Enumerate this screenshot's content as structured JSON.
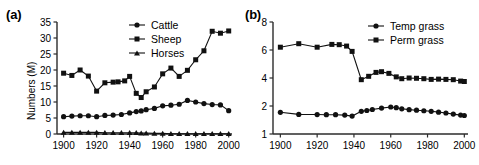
{
  "figure": {
    "panels": [
      {
        "id": "a",
        "label": "(a)",
        "ylabel": "Numbers (M)",
        "xlabel": "",
        "legend_position": "top-center"
      },
      {
        "id": "b",
        "label": "(b)",
        "ylabel": "Area (M ha)",
        "xlabel": "",
        "legend_position": "top-center"
      }
    ]
  },
  "chart_data": [
    {
      "type": "line",
      "title": "(a)",
      "xlabel": "",
      "ylabel": "Numbers (M)",
      "xlim": [
        1896,
        2002
      ],
      "ylim": [
        0,
        35
      ],
      "xticks": [
        1900,
        1920,
        1940,
        1960,
        1980,
        2000
      ],
      "xticklabels": [
        "1900",
        "1920",
        "1940",
        "1960",
        "1980",
        "2000"
      ],
      "yticks": [
        0,
        5,
        10,
        15,
        20,
        25,
        30,
        35
      ],
      "yticklabels": [
        "0",
        "5",
        "10",
        "15",
        "20",
        "25",
        "30",
        "35"
      ],
      "grid": false,
      "legend": [
        "Cattle",
        "Sheep",
        "Horses"
      ],
      "series": [
        {
          "name": "Cattle",
          "marker": "circle",
          "x": [
            1900,
            1905,
            1910,
            1915,
            1920,
            1925,
            1930,
            1935,
            1940,
            1944,
            1947,
            1950,
            1955,
            1960,
            1965,
            1970,
            1975,
            1980,
            1985,
            1990,
            1995,
            2000
          ],
          "values": [
            5.4,
            5.6,
            5.7,
            5.7,
            5.4,
            5.8,
            5.9,
            6.1,
            6.6,
            7.0,
            7.2,
            7.6,
            8.0,
            8.8,
            9.0,
            9.3,
            10.5,
            10.0,
            9.5,
            9.2,
            9.1,
            7.3
          ]
        },
        {
          "name": "Sheep",
          "marker": "square",
          "x": [
            1900,
            1905,
            1910,
            1915,
            1920,
            1925,
            1930,
            1933,
            1937,
            1940,
            1944,
            1947,
            1950,
            1955,
            1960,
            1965,
            1970,
            1975,
            1980,
            1985,
            1990,
            1995,
            2000
          ],
          "values": [
            19.0,
            18.3,
            20.0,
            18.1,
            13.4,
            16.0,
            16.2,
            16.3,
            16.6,
            18.0,
            12.7,
            11.4,
            13.2,
            14.7,
            18.8,
            20.6,
            18.0,
            19.9,
            23.2,
            26.0,
            32.1,
            31.5,
            32.2
          ]
        },
        {
          "name": "Horses",
          "marker": "triangle",
          "x": [
            1900,
            1905,
            1910,
            1915,
            1920,
            1925,
            1930,
            1935,
            1940,
            1944,
            1947,
            1950,
            1955,
            1960,
            1965,
            1970,
            1975,
            1980,
            1985,
            1990,
            1995,
            2000
          ],
          "values": [
            0.5,
            0.5,
            0.5,
            0.5,
            0.5,
            0.4,
            0.4,
            0.4,
            0.4,
            0.4,
            0.3,
            0.3,
            0.2,
            0.2,
            0.1,
            0.1,
            0.1,
            0.1,
            0.1,
            0.1,
            0.1,
            0.1
          ]
        }
      ]
    },
    {
      "type": "line",
      "title": "(b)",
      "xlabel": "",
      "ylabel": "Area (M ha)",
      "xlim": [
        1896,
        2002
      ],
      "ylim": [
        0,
        8
      ],
      "xticks": [
        1900,
        1920,
        1940,
        1960,
        1980,
        2000
      ],
      "xticklabels": [
        "1900",
        "1920",
        "1940",
        "1960",
        "1980",
        "2000"
      ],
      "yticks": [
        0,
        2,
        4,
        6,
        8
      ],
      "yticklabels": [
        "1",
        "2",
        "4",
        "6",
        "8"
      ],
      "grid": false,
      "legend": [
        "Temp grass",
        "Perm grass"
      ],
      "series": [
        {
          "name": "Temp grass",
          "marker": "circle",
          "x": [
            1900,
            1910,
            1920,
            1925,
            1930,
            1935,
            1939,
            1944,
            1947,
            1950,
            1955,
            1960,
            1963,
            1966,
            1970,
            1974,
            1978,
            1982,
            1986,
            1990,
            1994,
            1998,
            2000
          ],
          "values": [
            1.55,
            1.4,
            1.39,
            1.38,
            1.38,
            1.35,
            1.28,
            1.62,
            1.68,
            1.75,
            1.85,
            1.93,
            1.88,
            1.8,
            1.74,
            1.7,
            1.66,
            1.62,
            1.56,
            1.5,
            1.42,
            1.35,
            1.32
          ]
        },
        {
          "name": "Perm grass",
          "marker": "square",
          "x": [
            1900,
            1910,
            1920,
            1928,
            1932,
            1936,
            1939,
            1944,
            1948,
            1952,
            1955,
            1959,
            1963,
            1966,
            1970,
            1974,
            1978,
            1982,
            1986,
            1990,
            1994,
            1998,
            2000
          ],
          "values": [
            6.2,
            6.45,
            6.2,
            6.4,
            6.38,
            6.28,
            5.9,
            3.88,
            4.12,
            4.4,
            4.45,
            4.33,
            4.08,
            3.95,
            4.0,
            3.98,
            3.95,
            3.9,
            3.92,
            3.9,
            3.88,
            3.78,
            3.75
          ]
        }
      ]
    }
  ]
}
